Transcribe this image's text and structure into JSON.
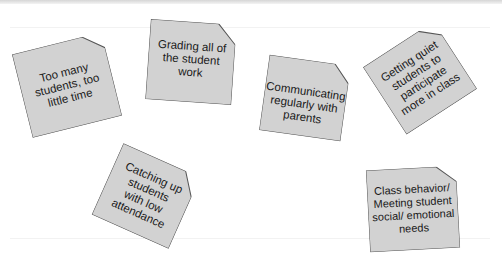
{
  "notes": [
    {
      "id": "too-many-students",
      "text": "Too many students, too little time"
    },
    {
      "id": "grading",
      "text": "Grading all of the student work"
    },
    {
      "id": "communicating",
      "text": "Communicating regularly with parents"
    },
    {
      "id": "quiet-students",
      "text": "Getting quiet students to participate more in class"
    },
    {
      "id": "catching-up",
      "text": "Catching up students with low attendance"
    },
    {
      "id": "class-behavior",
      "text": "Class behavior/ Meeting student social/ emotional needs"
    }
  ],
  "colors": {
    "note_fill": "#d2d2d2",
    "note_border": "#555555",
    "text": "#1a1a1a",
    "background": "#ffffff"
  }
}
